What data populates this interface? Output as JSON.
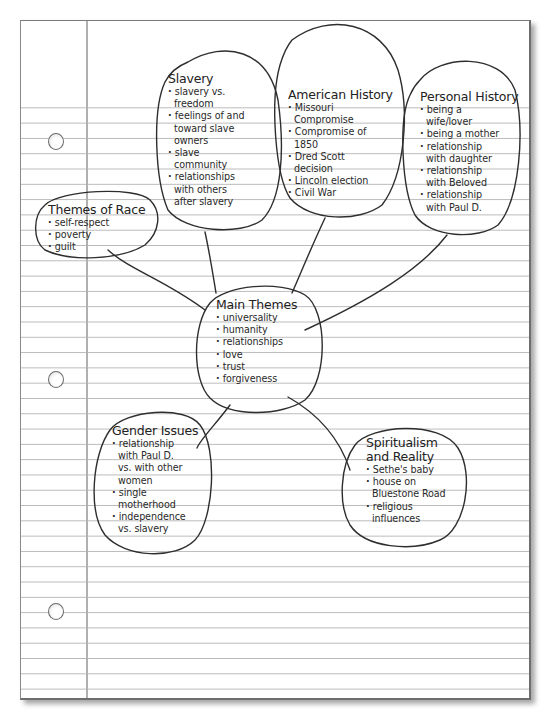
{
  "diagram": {
    "type": "mind-map / web diagram on notebook paper",
    "center": {
      "title": "Main Themes",
      "items": [
        "universality",
        "humanity",
        "relationships",
        "love",
        "trust",
        "forgiveness"
      ]
    },
    "nodes": [
      {
        "id": "slavery",
        "title": "Slavery",
        "items": [
          "slavery vs. freedom",
          "feelings of and toward slave owners",
          "slave community",
          "relationships with others after slavery"
        ]
      },
      {
        "id": "american-history",
        "title": "American History",
        "items": [
          "Missouri Compromise",
          "Compromise of 1850",
          "Dred Scott decision",
          "Lincoln election",
          "Civil War"
        ]
      },
      {
        "id": "personal-history",
        "title": "Personal History",
        "items": [
          "being a wife/lover",
          "being a mother",
          "relationship with daughter",
          "relationship with Beloved",
          "relationship with Paul D."
        ]
      },
      {
        "id": "themes-of-race",
        "title": "Themes of Race",
        "items": [
          "self-respect",
          "poverty",
          "guilt"
        ]
      },
      {
        "id": "gender-issues",
        "title": "Gender Issues",
        "items": [
          "relationship with Paul D. vs. with other women",
          "single motherhood",
          "independence vs. slavery"
        ]
      },
      {
        "id": "spiritualism",
        "title": "Spiritualism and Reality",
        "items": [
          "Sethe's baby",
          "house on Bluestone Road",
          "religious influences"
        ]
      }
    ],
    "edges": [
      [
        "main-themes",
        "slavery"
      ],
      [
        "main-themes",
        "american-history"
      ],
      [
        "main-themes",
        "personal-history"
      ],
      [
        "main-themes",
        "themes-of-race"
      ],
      [
        "main-themes",
        "gender-issues"
      ],
      [
        "main-themes",
        "spiritualism"
      ]
    ]
  },
  "lines": {
    "slavery": [
      "slavery vs.",
      "freedom",
      "feelings of and",
      "toward slave",
      "owners",
      "slave",
      "community",
      "relationships",
      "with others",
      "after slavery"
    ],
    "american": [
      "Missouri",
      "Compromise",
      "Compromise of",
      "1850",
      "Dred Scott",
      "decision",
      "Lincoln election",
      "Civil War"
    ],
    "personal": [
      "being a",
      "wife/lover",
      "being a mother",
      "relationship",
      "with daughter",
      "relationship",
      "with Beloved",
      "relationship",
      "with Paul D."
    ],
    "race": [
      "self-respect",
      "poverty",
      "guilt"
    ],
    "main": [
      "universality",
      "humanity",
      "relationships",
      "love",
      "trust",
      "forgiveness"
    ],
    "gender": [
      "relationship",
      "with Paul D.",
      "vs. with other",
      "women",
      "single",
      "motherhood",
      "independence",
      "vs. slavery"
    ],
    "spirit": [
      "Spiritualism",
      "and Reality",
      "Sethe's baby",
      "house on",
      "Bluestone Road",
      "religious",
      "influences"
    ]
  },
  "colors": {
    "ink": "#2a2a2a",
    "rule_lines": "#b9b9b9",
    "margin_line": "#b0b0b0",
    "paper": "#ffffff"
  }
}
